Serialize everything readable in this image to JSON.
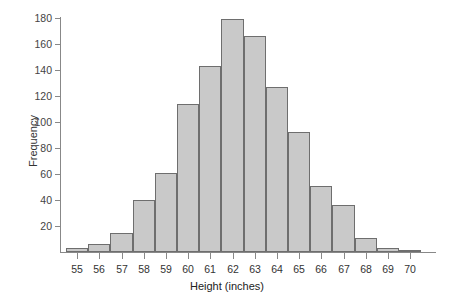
{
  "chart_data": {
    "type": "bar",
    "title": "",
    "subtitle": "",
    "xlabel": "Height (inches)",
    "ylabel": "Frequency",
    "categories": [
      "55",
      "56",
      "57",
      "58",
      "59",
      "60",
      "61",
      "62",
      "63",
      "64",
      "65",
      "66",
      "67",
      "68",
      "69",
      "70"
    ],
    "values": [
      3,
      6,
      15,
      40,
      61,
      114,
      143,
      179,
      166,
      127,
      92,
      51,
      36,
      11,
      3,
      1
    ],
    "xlim": [
      54.5,
      70.5
    ],
    "ylim": [
      0,
      180
    ],
    "ytick_labels": [
      "180",
      "160",
      "140",
      "120",
      "100",
      "80",
      "60",
      "40",
      "20"
    ],
    "ytick_values": [
      180,
      160,
      140,
      120,
      100,
      80,
      60,
      40,
      20
    ],
    "ytick_step": 20,
    "grid": false,
    "legend": false,
    "legend_position": "none",
    "bar_fill_color": "#c9c9c9",
    "bar_border_color": "#6e6e6e",
    "axis_color": "#888888",
    "background_color": "#ffffff",
    "annotations": []
  }
}
